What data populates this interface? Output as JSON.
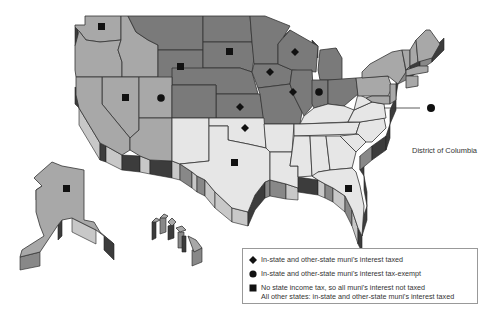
{
  "map": {
    "type": "US state map (3D extruded)",
    "colors": {
      "dark": "#7a7a7a",
      "medium": "#a8a8a8",
      "light": "#e6e6e6",
      "extrusion": "#3c3c3c"
    },
    "dc_label": "District of Columbia",
    "markers": [
      {
        "state": "Washington",
        "symbol": "square"
      },
      {
        "state": "Wyoming",
        "symbol": "square"
      },
      {
        "state": "South Dakota",
        "symbol": "square"
      },
      {
        "state": "Nevada",
        "symbol": "square"
      },
      {
        "state": "Utah",
        "symbol": "circle"
      },
      {
        "state": "Wisconsin",
        "symbol": "diamond"
      },
      {
        "state": "Iowa",
        "symbol": "diamond"
      },
      {
        "state": "Illinois",
        "symbol": "diamond"
      },
      {
        "state": "Indiana",
        "symbol": "circle"
      },
      {
        "state": "Kansas",
        "symbol": "diamond"
      },
      {
        "state": "Oklahoma",
        "symbol": "diamond"
      },
      {
        "state": "Texas",
        "symbol": "square"
      },
      {
        "state": "Florida",
        "symbol": "square"
      },
      {
        "state": "Alaska",
        "symbol": "square"
      },
      {
        "state": "District of Columbia",
        "symbol": "circle"
      }
    ]
  },
  "legend": {
    "items": [
      {
        "symbol": "diamond",
        "label": "In-state and other-state muni's interest taxed"
      },
      {
        "symbol": "circle",
        "label": "In-state and other-state muni's interest tax-exempt"
      },
      {
        "symbol": "square",
        "label": "No state income tax, so all muni's interest not taxed"
      }
    ],
    "note": "All other states: in-state and other-state muni's interest taxed"
  }
}
